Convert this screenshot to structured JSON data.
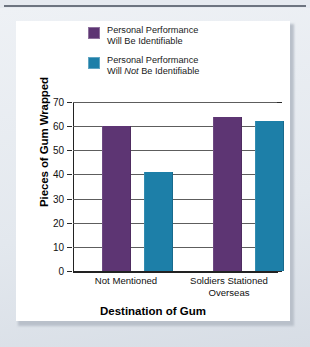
{
  "chart_data": {
    "type": "bar",
    "title": "",
    "xlabel": "Destination of Gum",
    "ylabel": "Pieces of Gum Wrapped",
    "categories": [
      "Not Mentioned",
      "Soldiers Stationed Overseas"
    ],
    "category_lines": [
      [
        "Not Mentioned"
      ],
      [
        "Soldiers Stationed",
        "Overseas"
      ]
    ],
    "series": [
      {
        "name": "Personal Performance Will Be Identifiable",
        "name_lines": [
          "Personal Performance",
          "Will Be Identifiable"
        ],
        "color": "#5d3573",
        "values": [
          60,
          64
        ]
      },
      {
        "name": "Personal Performance Will Not Be Identifiable",
        "name_lines": [
          "Personal Performance",
          "Will Not Be Identifiable"
        ],
        "color": "#1d7fa8",
        "values": [
          41,
          62
        ]
      }
    ],
    "ylim": [
      0,
      70
    ],
    "yticks": [
      0,
      10,
      20,
      30,
      40,
      50,
      60,
      70
    ],
    "ytick_labels": [
      "0",
      "10",
      "20",
      "30",
      "40",
      "50",
      "60",
      "70"
    ],
    "grid": "horizontal",
    "legend_position": "top-center"
  },
  "legend": {
    "items": [
      {
        "line1": "Personal Performance",
        "line2_pre": "Will ",
        "line2_em": "",
        "line2_post": "Be Identifiable",
        "swatch": "purple-swatch"
      },
      {
        "line1": "Personal Performance",
        "line2_pre": "Will ",
        "line2_em": "Not",
        "line2_post": " Be Identifiable",
        "swatch": "blue-swatch"
      }
    ]
  },
  "axes": {
    "y_title": "Pieces of Gum Wrapped",
    "x_title": "Destination of Gum",
    "y_labels": [
      "70",
      "60",
      "50",
      "40",
      "30",
      "20",
      "10",
      "0"
    ],
    "x_labels": [
      {
        "line1": "Not Mentioned",
        "line2": ""
      },
      {
        "line1": "Soldiers Stationed",
        "line2": "Overseas"
      }
    ]
  },
  "colors": {
    "series_purple": "#5d3573",
    "series_blue": "#1d7fa8",
    "gridline": "#5d5d5d",
    "axis": "#222222",
    "card": "#ffffff",
    "page": "#e6eaf0"
  }
}
